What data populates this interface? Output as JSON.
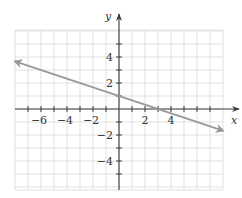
{
  "chart_data": {
    "type": "line",
    "title": "",
    "xlabel": "x",
    "ylabel": "y",
    "xlim": [
      -8,
      8
    ],
    "ylim": [
      -6,
      6
    ],
    "grid": true,
    "grid_step": 1,
    "x_tick_step": 1,
    "y_tick_step": 1,
    "x_tick_labels": [
      {
        "value": -6,
        "label": "−6"
      },
      {
        "value": -4,
        "label": "−4"
      },
      {
        "value": -2,
        "label": "−2"
      },
      {
        "value": 2,
        "label": "2"
      },
      {
        "value": 4,
        "label": "4"
      }
    ],
    "y_tick_labels": [
      {
        "value": 4,
        "label": "4"
      },
      {
        "value": 2,
        "label": "2"
      },
      {
        "value": -2,
        "label": "−2"
      },
      {
        "value": -4,
        "label": "−4"
      }
    ],
    "series": [
      {
        "name": "y = -x/3 + 1",
        "equation": {
          "slope": -0.3333,
          "intercept": 1
        },
        "x": [
          -8,
          8
        ],
        "y": [
          3.667,
          -1.667
        ],
        "arrows": "both",
        "color": "#999999"
      }
    ],
    "axis_color": "#3a3a3a",
    "grid_color": "#d9d9d9"
  }
}
